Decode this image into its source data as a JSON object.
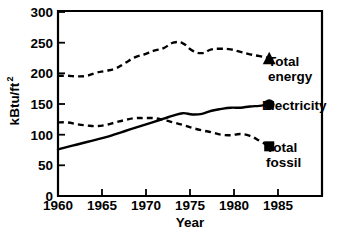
{
  "chart_data": {
    "type": "line",
    "title": "",
    "xlabel": "Year",
    "ylabel": "kBtu/ft2",
    "ylabel_base": "kBtu/ft",
    "ylabel_sup": "2",
    "xlim": [
      1960,
      1987.5
    ],
    "ylim": [
      0,
      300
    ],
    "grid": false,
    "legend_position": "inline-right",
    "xticks": [
      1960,
      1965,
      1970,
      1975,
      1980,
      1985
    ],
    "xtick_labels": [
      "1960",
      "1965",
      "1970",
      "1975",
      "1980",
      "1985"
    ],
    "yticks": [
      0,
      50,
      100,
      150,
      200,
      250,
      300
    ],
    "ytick_labels": [
      "0",
      "50",
      "100",
      "150",
      "200",
      "250",
      "300"
    ],
    "x": [
      1960,
      1961,
      1962,
      1963,
      1964,
      1965,
      1966,
      1967,
      1968,
      1969,
      1970,
      1971,
      1972,
      1973,
      1974,
      1975,
      1976,
      1977,
      1978,
      1979,
      1980,
      1981,
      1982
    ],
    "series": [
      {
        "name": "Total energy",
        "label_line1": "Total",
        "label_line2": "energy",
        "style": "dashed",
        "marker": "triangle",
        "values": [
          196,
          196,
          195,
          196,
          201,
          204,
          208,
          217,
          226,
          231,
          237,
          241,
          250,
          249,
          237,
          233,
          239,
          240,
          239,
          235,
          231,
          228,
          225
        ]
      },
      {
        "name": "Electricity",
        "label_line1": "Electricity",
        "label_line2": "",
        "style": "solid",
        "marker": "circle",
        "values": [
          76,
          80,
          84,
          88,
          92,
          96,
          101,
          106,
          111,
          116,
          121,
          126,
          131,
          135,
          133,
          134,
          139,
          142,
          144,
          144,
          146,
          147,
          149
        ]
      },
      {
        "name": "Total fossil",
        "label_line1": "Total",
        "label_line2": "fossil",
        "style": "dashed",
        "marker": "square",
        "values": [
          120,
          120,
          117,
          115,
          114,
          116,
          120,
          124,
          127,
          127,
          127,
          124,
          120,
          116,
          111,
          107,
          104,
          100,
          99,
          101,
          98,
          90,
          81
        ]
      }
    ]
  },
  "axis": {
    "y_title_base": "kBtu/ft",
    "y_title_sup": "2",
    "x_title": "Year"
  }
}
